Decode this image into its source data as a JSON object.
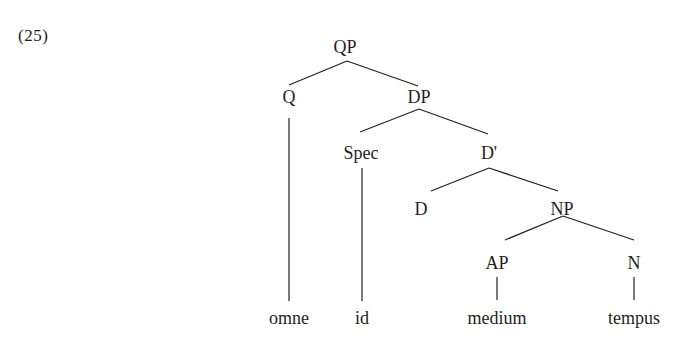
{
  "example": {
    "number": "(25)"
  },
  "tree": {
    "nodes": {
      "qp": "QP",
      "q": "Q",
      "dp": "DP",
      "spec": "Spec",
      "dbar": "D'",
      "d": "D",
      "np": "NP",
      "ap": "AP",
      "n": "N"
    },
    "leaves": {
      "omne": "omne",
      "id": "id",
      "medium": "medium",
      "tempus": "tempus"
    }
  }
}
